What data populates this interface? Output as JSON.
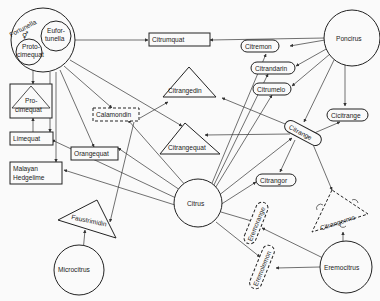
{
  "diagram": {
    "type": "genus relationship diagram",
    "genera": {
      "fortunella": "Fortunella",
      "eufortunella": "Eufor-tunella",
      "eufortunella_l1": "Eufor-",
      "eufortunella_l2": "tunella",
      "protocimequat_l1": "Proto-",
      "protocimequat_l2": "cimequat",
      "poncirus": "Poncirus",
      "citrus": "Citrus",
      "microcitrus": "Microcitrus",
      "eremocitrus": "Eremocitrus"
    },
    "hybrids": {
      "citrumquat": "Citrumquat",
      "procimequat_l1": "Pro-",
      "procimequat_l2": "cimequat",
      "limequat": "Limequat",
      "malayan_l1": "Malayan",
      "malayan_l2": "Hedgelime",
      "calamondin": "Calamondin",
      "orangequat": "Orangequat",
      "citrangedin": "Citrangedin",
      "citrangequat": "Citrangequat",
      "citremon": "Citremon",
      "citrandarin": "Citrandarin",
      "citrumelo": "Citrumelo",
      "citrange": "Citrange",
      "cicitrange": "Cicitrange",
      "citrangor": "Citrangor",
      "citrangermo": "Citrangermo",
      "faustrimidin": "Faustrimidin",
      "eremorange": "Eremorange",
      "eremolemon": "Eremolemon"
    },
    "symbol": "⚥"
  }
}
